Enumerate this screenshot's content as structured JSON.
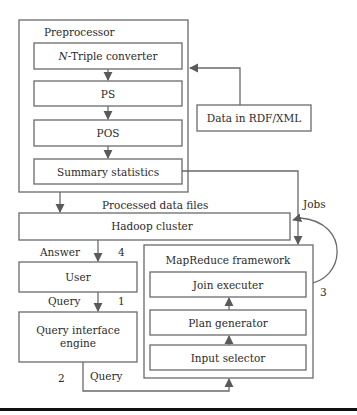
{
  "diagram": {
    "preprocessor": {
      "title": "Preprocessor",
      "steps": [
        {
          "prefix": "N",
          "label": "-Triple converter"
        },
        {
          "label": "PS"
        },
        {
          "label": "POS"
        },
        {
          "label": "Summary statistics"
        }
      ]
    },
    "data_source": {
      "label": "Data in RDF/XML"
    },
    "processed_label": "Processed data files",
    "hadoop": {
      "label": "Hadoop cluster"
    },
    "jobs_label": "Jobs",
    "answer_label": "Answer",
    "user": {
      "label": "User"
    },
    "query_label_1": "Query",
    "query_engine": {
      "line1": "Query interface",
      "line2": "engine"
    },
    "query_label_2": "Query",
    "mapreduce": {
      "title": "MapReduce framework",
      "components": [
        {
          "label": "Join executer"
        },
        {
          "label": "Plan generator"
        },
        {
          "label": "Input selector"
        }
      ]
    },
    "step_numbers": {
      "one": "1",
      "two": "2",
      "three": "3",
      "four": "4"
    }
  }
}
